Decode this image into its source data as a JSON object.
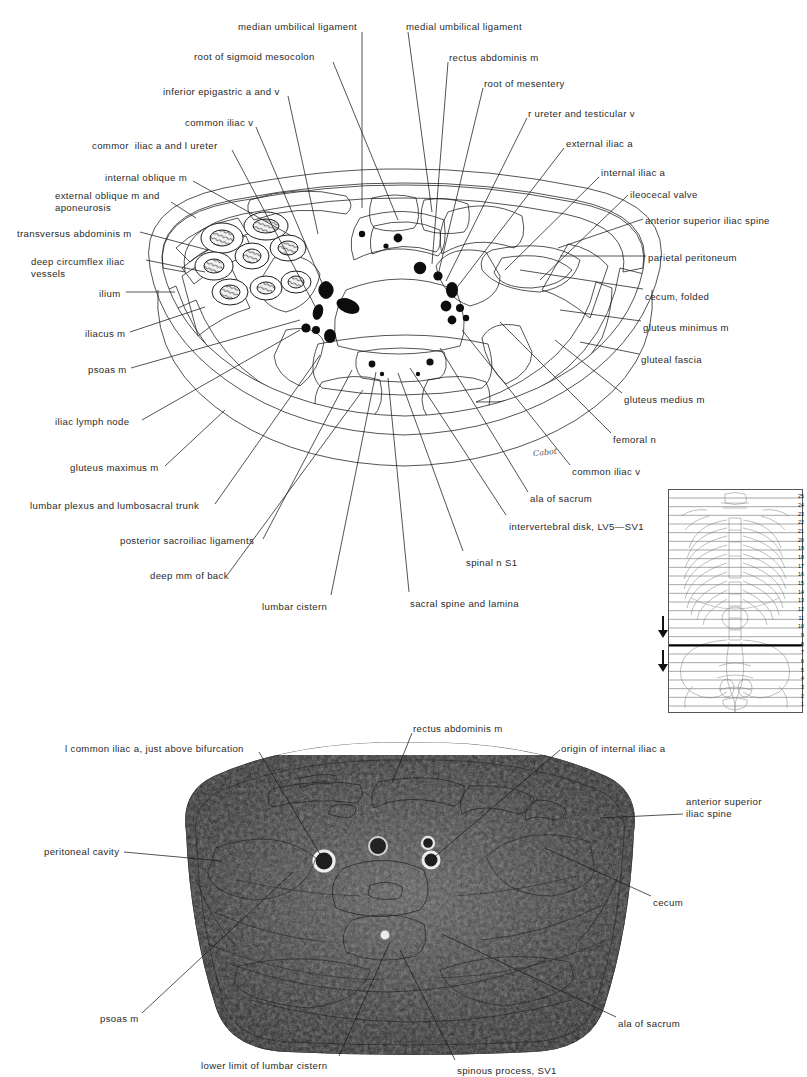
{
  "figure1": {
    "kind": "anatomical-line-drawing",
    "caption_artist_signature": "Cabot",
    "labels_left": [
      {
        "id": "root-of-sigmoid-mesocolon",
        "text": "root of sigmoid mesocolon",
        "x": 194,
        "y": 51,
        "align": "left",
        "leader": [
          [
            333,
            62
          ],
          [
            398,
            220
          ]
        ]
      },
      {
        "id": "inferior-epigastric-a-and-v",
        "text": "inferior epigastric a and v",
        "x": 163,
        "y": 86,
        "align": "left",
        "leader": [
          [
            288,
            96
          ],
          [
            318,
            234
          ]
        ]
      },
      {
        "id": "common-iliac-v",
        "text": "common iliac v",
        "x": 185,
        "y": 117,
        "align": "left",
        "leader": [
          [
            256,
            127
          ],
          [
            325,
            290
          ]
        ]
      },
      {
        "id": "common-iliac-a-and-l-ureter",
        "text": "commor  iliac a and l ureter",
        "x": 92,
        "y": 140,
        "align": "left",
        "leader": [
          [
            232,
            150
          ],
          [
            317,
            310
          ]
        ]
      },
      {
        "id": "internal-oblique-m",
        "text": "internal oblique m",
        "x": 105,
        "y": 172,
        "align": "left",
        "leader": [
          [
            193,
            181
          ],
          [
            290,
            235
          ]
        ]
      },
      {
        "id": "external-oblique-m-and-aponeurosis",
        "text": "external oblique m and\naponeurosis",
        "x": 55,
        "y": 190,
        "align": "left",
        "leader": [
          [
            171,
            202
          ],
          [
            196,
            218
          ]
        ]
      },
      {
        "id": "transversus-abdominis-m",
        "text": "transversus abdominis m",
        "x": 17,
        "y": 228,
        "align": "left",
        "leader": [
          [
            140,
            232
          ],
          [
            208,
            250
          ]
        ]
      },
      {
        "id": "deep-circumflex-iliac-vessels",
        "text": "deep circumflex iliac\nvessels",
        "x": 31,
        "y": 256,
        "align": "left",
        "leader": [
          [
            146,
            260
          ],
          [
            205,
            272
          ]
        ]
      },
      {
        "id": "ilium",
        "text": "ilium",
        "x": 99,
        "y": 288,
        "align": "left",
        "leader": [
          [
            126,
            292
          ],
          [
            175,
            292
          ]
        ]
      },
      {
        "id": "iliacus-m",
        "text": "iliacus m",
        "x": 85,
        "y": 328,
        "align": "left",
        "leader": [
          [
            130,
            332
          ],
          [
            205,
            307
          ]
        ]
      },
      {
        "id": "psoas-m",
        "text": "psoas m",
        "x": 88,
        "y": 364,
        "align": "left",
        "leader": [
          [
            131,
            368
          ],
          [
            300,
            320
          ]
        ]
      },
      {
        "id": "iliac-lymph-node",
        "text": "iliac lymph node",
        "x": 55,
        "y": 416,
        "align": "left",
        "leader": [
          [
            142,
            420
          ],
          [
            300,
            330
          ]
        ]
      },
      {
        "id": "gluteus-maximus-m",
        "text": "gluteus maximus m",
        "x": 70,
        "y": 462,
        "align": "left",
        "leader": [
          [
            165,
            466
          ],
          [
            225,
            410
          ]
        ]
      },
      {
        "id": "lumbar-plexus-and-lumbosacral-trunk",
        "text": "lumbar plexus and lumbosacral trunk",
        "x": 30,
        "y": 500,
        "align": "left",
        "leader": [
          [
            215,
            504
          ],
          [
            320,
            355
          ]
        ]
      },
      {
        "id": "posterior-sacroiliac-ligaments",
        "text": "posterior sacroiliac ligaments",
        "x": 120,
        "y": 535,
        "align": "left",
        "leader": [
          [
            263,
            539
          ],
          [
            352,
            370
          ]
        ]
      },
      {
        "id": "deep-mm-of-back",
        "text": "deep mm of back",
        "x": 150,
        "y": 570,
        "align": "left",
        "leader": [
          [
            228,
            574
          ],
          [
            363,
            390
          ]
        ]
      },
      {
        "id": "lumbar-cistern",
        "text": "lumbar cistern",
        "x": 262,
        "y": 601,
        "align": "left",
        "leader": [
          [
            331,
            595
          ],
          [
            376,
            372
          ]
        ]
      },
      {
        "id": "sacral-spine-and-lamina",
        "text": "sacral spine and lamina",
        "x": 410,
        "y": 598,
        "align": "left",
        "leader": [
          [
            409,
            592
          ],
          [
            388,
            378
          ]
        ]
      },
      {
        "id": "spinal-n-s1",
        "text": "spinal n S1",
        "x": 466,
        "y": 557,
        "align": "left",
        "leader": [
          [
            463,
            551
          ],
          [
            398,
            373
          ]
        ]
      },
      {
        "id": "intervertebral-disk",
        "text": "intervertebral disk, LV5—SV1",
        "x": 509,
        "y": 521,
        "align": "left",
        "leader": [
          [
            506,
            515
          ],
          [
            410,
            368
          ]
        ]
      }
    ],
    "labels_top": [
      {
        "id": "median-umbilical-ligament",
        "text": "median umbilical ligament",
        "x": 238,
        "y": 21,
        "align": "left",
        "leader": [
          [
            362,
            32
          ],
          [
            362,
            208
          ]
        ]
      },
      {
        "id": "medial-umbilical-ligament",
        "text": "medial umbilical ligament",
        "x": 406,
        "y": 21,
        "align": "left",
        "leader": [
          [
            408,
            32
          ],
          [
            432,
            212
          ]
        ]
      }
    ],
    "labels_right": [
      {
        "id": "rectus-abdominis-m",
        "text": "rectus abdominis m",
        "x": 449,
        "y": 52,
        "align": "left",
        "leader": [
          [
            448,
            62
          ],
          [
            432,
            264
          ]
        ]
      },
      {
        "id": "root-of-mesentery",
        "text": "root of mesentery",
        "x": 484,
        "y": 78,
        "align": "left",
        "leader": [
          [
            483,
            88
          ],
          [
            438,
            275
          ]
        ]
      },
      {
        "id": "r-ureter-and-testicular-v",
        "text": "r ureter and testicular v",
        "x": 528,
        "y": 108,
        "align": "left",
        "leader": [
          [
            527,
            118
          ],
          [
            446,
            281
          ]
        ]
      },
      {
        "id": "external-iliac-a",
        "text": "external iliac a",
        "x": 566,
        "y": 138,
        "align": "left",
        "leader": [
          [
            564,
            148
          ],
          [
            455,
            290
          ]
        ]
      },
      {
        "id": "internal-iliac-a",
        "text": "internal iliac a",
        "x": 601,
        "y": 167,
        "align": "left",
        "leader": [
          [
            599,
            177
          ],
          [
            505,
            270
          ]
        ]
      },
      {
        "id": "ileocecal-valve",
        "text": "ileocecal valve",
        "x": 630,
        "y": 189,
        "align": "left",
        "leader": [
          [
            628,
            195
          ],
          [
            540,
            280
          ]
        ]
      },
      {
        "id": "anterior-superior-iliac-spine",
        "text": "anterior superior iliac spine",
        "x": 645,
        "y": 215,
        "align": "left",
        "leader": [
          [
            643,
            219
          ],
          [
            558,
            248
          ]
        ]
      },
      {
        "id": "parietal-peritoneum",
        "text": "parietal peritoneum",
        "x": 648,
        "y": 252,
        "align": "left",
        "leader": [
          [
            646,
            256
          ],
          [
            560,
            256
          ]
        ]
      },
      {
        "id": "cecum-folded",
        "text": "cecum, folded",
        "x": 645,
        "y": 291,
        "align": "left",
        "leader": [
          [
            643,
            289
          ],
          [
            520,
            270
          ]
        ]
      },
      {
        "id": "gluteus-minimus-m",
        "text": "gluteus minimus m",
        "x": 643,
        "y": 322,
        "align": "left",
        "leader": [
          [
            641,
            321
          ],
          [
            560,
            310
          ]
        ]
      },
      {
        "id": "gluteal-fascia",
        "text": "gluteal fascia",
        "x": 641,
        "y": 354,
        "align": "left",
        "leader": [
          [
            639,
            354
          ],
          [
            580,
            342
          ]
        ]
      },
      {
        "id": "gluteus-medius-m",
        "text": "gluteus medius m",
        "x": 624,
        "y": 394,
        "align": "left",
        "leader": [
          [
            622,
            393
          ],
          [
            555,
            340
          ]
        ]
      },
      {
        "id": "femoral-n",
        "text": "femoral n",
        "x": 613,
        "y": 434,
        "align": "left",
        "leader": [
          [
            611,
            433
          ],
          [
            500,
            322
          ]
        ]
      },
      {
        "id": "common-iliac-v-r",
        "text": "common iliac v",
        "x": 572,
        "y": 466,
        "align": "left",
        "leader": [
          [
            570,
            465
          ],
          [
            462,
            330
          ]
        ]
      },
      {
        "id": "ala-of-sacrum",
        "text": "ala of sacrum",
        "x": 530,
        "y": 493,
        "align": "left",
        "leader": [
          [
            528,
            492
          ],
          [
            440,
            348
          ]
        ]
      }
    ]
  },
  "inset": {
    "kind": "skeleton-level-key",
    "levels": [
      25,
      24,
      23,
      22,
      21,
      20,
      19,
      18,
      17,
      16,
      15,
      14,
      13,
      12,
      11,
      10,
      9,
      8,
      7,
      6,
      5,
      4,
      3,
      2,
      1
    ],
    "current_level": 8,
    "arrow_up": "▲",
    "arrow_down": "▼"
  },
  "figure2": {
    "kind": "anatomical-photograph",
    "labels": [
      {
        "id": "l-common-iliac-a-just-above-bifurcation",
        "text": "l common iliac a, just above bifurcation",
        "x": 65,
        "y": 743,
        "align": "left",
        "leader": [
          [
            259,
            752
          ],
          [
            324,
            861
          ]
        ]
      },
      {
        "id": "rectus-abdominis-m-2",
        "text": "rectus abdominis m",
        "x": 413,
        "y": 723,
        "align": "left",
        "leader": [
          [
            412,
            733
          ],
          [
            392,
            783
          ]
        ]
      },
      {
        "id": "origin-of-internal-iliac-a",
        "text": "origin of internal iliac a",
        "x": 561,
        "y": 743,
        "align": "left",
        "leader": [
          [
            560,
            750
          ],
          [
            431,
            860
          ]
        ]
      },
      {
        "id": "anterior-superior-iliac-spine-2",
        "text": "anterior superior\niliac spine",
        "x": 686,
        "y": 796,
        "align": "left",
        "leader": [
          [
            683,
            814
          ],
          [
            600,
            818
          ]
        ]
      },
      {
        "id": "peritoneal-cavity",
        "text": "peritoneal cavity",
        "x": 44,
        "y": 846,
        "align": "left",
        "leader": [
          [
            124,
            852
          ],
          [
            222,
            861
          ]
        ]
      },
      {
        "id": "cecum-2",
        "text": "cecum",
        "x": 653,
        "y": 897,
        "align": "left",
        "leader": [
          [
            651,
            896
          ],
          [
            545,
            848
          ]
        ]
      },
      {
        "id": "ala-of-sacrum-2",
        "text": "ala of sacrum",
        "x": 618,
        "y": 1018,
        "align": "left",
        "leader": [
          [
            616,
            1017
          ],
          [
            442,
            934
          ]
        ]
      },
      {
        "id": "psoas-m-2",
        "text": "psoas m",
        "x": 100,
        "y": 1013,
        "align": "left",
        "leader": [
          [
            142,
            1013
          ],
          [
            293,
            872
          ]
        ]
      },
      {
        "id": "lower-limit-of-lumbar-cistern",
        "text": "lower limit of lumbar cistern",
        "x": 201,
        "y": 1060,
        "align": "left",
        "leader": [
          [
            339,
            1056
          ],
          [
            390,
            942
          ]
        ]
      },
      {
        "id": "spinous-process-sv1",
        "text": "spinous process, SV1",
        "x": 457,
        "y": 1065,
        "align": "left",
        "leader": [
          [
            455,
            1060
          ],
          [
            400,
            950
          ]
        ]
      }
    ]
  }
}
